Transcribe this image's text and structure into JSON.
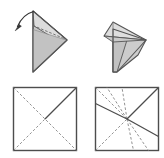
{
  "figure": {
    "title": "Origami folding step: crease pattern and folded form",
    "background_color": "#ffffff",
    "width": 164,
    "height": 158,
    "stroke_color": "#4d4d4d",
    "crease_dashed_color": "#8c8c8c",
    "crease_solid_color": "#4d4d4d",
    "fill_light": "#d9d9d9",
    "fill_mid": "#c6c6c6",
    "fill_dark": "#b3b3b3",
    "panels": [
      {
        "id": "panel-top-left",
        "name": "folded-model-before",
        "row": "top",
        "column": "left",
        "caption": "",
        "description": "Triangular folded paper with vertical left edge and point to the right, showing a dashed fold line and a curved arrow indicating the fold direction",
        "has_arrow": true,
        "arrow": {
          "name": "fold-direction-arrow",
          "from": [
            33,
            11
          ],
          "to": [
            16,
            29
          ],
          "curved": true,
          "head_at": "to",
          "description": "curved arrow sweeping from top apex down and to the left"
        }
      },
      {
        "id": "panel-top-right",
        "name": "folded-model-after",
        "row": "top",
        "column": "right",
        "caption": "",
        "description": "Resulting folded paper: upper flap folded down to the left forming a small triangle over a larger kite-shaped body",
        "has_arrow": false
      },
      {
        "id": "panel-bottom-left",
        "name": "crease-pattern-before",
        "row": "bottom",
        "column": "left",
        "caption": "",
        "description": "Square crease pattern with both dashed diagonals and one solid diagonal from center to the top-right corner",
        "square": {
          "x": 13,
          "y": 87,
          "size": 64
        },
        "creases": [
          {
            "name": "diagonal-bottomleft-topright",
            "style": "dashed",
            "from": [
              0,
              1
            ],
            "to": [
              1,
              0
            ]
          },
          {
            "name": "diagonal-topleft-bottomright",
            "style": "dashed",
            "from": [
              0,
              0
            ],
            "to": [
              1,
              1
            ]
          },
          {
            "name": "fold-center-to-topright",
            "style": "solid",
            "from": [
              0.5,
              0.5
            ],
            "to": [
              1,
              0
            ]
          }
        ]
      },
      {
        "id": "panel-bottom-right",
        "name": "crease-pattern-after",
        "row": "bottom",
        "column": "right",
        "caption": "",
        "description": "Square crease pattern with dashed diagonals, extra dashed rays radiating from the center, a solid diagonal to the top-right corner, a solid line to the left edge and a solid line to the right edge",
        "square": {
          "x": 95,
          "y": 87,
          "size": 64
        },
        "creases": [
          {
            "name": "diagonal-bottomleft-topright",
            "style": "dashed",
            "from": [
              0,
              1
            ],
            "to": [
              1,
              0
            ]
          },
          {
            "name": "diagonal-topleft-center",
            "style": "dashed",
            "from": [
              0,
              0
            ],
            "to": [
              0.5,
              0.5
            ]
          },
          {
            "name": "ray-center-to-top-left-of-center",
            "style": "dashed",
            "from": [
              0.5,
              0.5
            ],
            "to": [
              0.18,
              0
            ]
          },
          {
            "name": "ray-center-to-top-right-of-center",
            "style": "dashed",
            "from": [
              0.5,
              0.5
            ],
            "to": [
              0.42,
              0
            ]
          },
          {
            "name": "ray-center-to-bottom-left-of-center",
            "style": "dashed",
            "from": [
              0.5,
              0.5
            ],
            "to": [
              0.6,
              1
            ]
          },
          {
            "name": "ray-center-to-bottom-right-of-center",
            "style": "dashed",
            "from": [
              0.5,
              0.5
            ],
            "to": [
              0.84,
              1
            ]
          },
          {
            "name": "fold-center-to-topright",
            "style": "solid",
            "from": [
              0.5,
              0.5
            ],
            "to": [
              1,
              0
            ]
          },
          {
            "name": "fold-center-to-left-edge",
            "style": "solid",
            "from": [
              0.5,
              0.5
            ],
            "to": [
              0,
              0.25
            ]
          },
          {
            "name": "fold-center-to-right-edge",
            "style": "solid",
            "from": [
              0.5,
              0.5
            ],
            "to": [
              1,
              0.78
            ]
          }
        ]
      }
    ]
  }
}
